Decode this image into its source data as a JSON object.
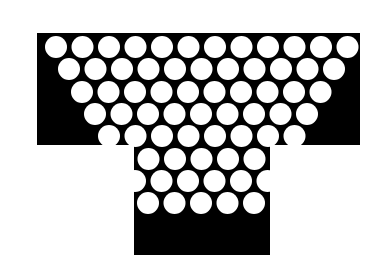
{
  "canvas": {
    "width": 372,
    "height": 255,
    "background_color": "#ffffff"
  },
  "figure": {
    "name": "perforated-t-shape",
    "fill_color": "#000000",
    "hole_color": "#ffffff"
  },
  "shape_geometry": {
    "top_bar": {
      "x": 37,
      "y": 33,
      "width": 323,
      "height": 112,
      "left": 37,
      "right": 360,
      "top": 33,
      "bottom": 145
    },
    "stem": {
      "x": 134,
      "y": 145,
      "width": 136,
      "height": 110,
      "left": 134,
      "right": 270,
      "top": 145,
      "bottom": 255
    }
  },
  "hole_pattern": {
    "type": "inverted-triangle-hex-packing",
    "radius": 11,
    "x_pitch": 26.5,
    "y_pitch": 22.4,
    "first_row_center_x": 56,
    "first_row_center_y": 47,
    "row_count": 8,
    "top_row_hole_count": 12,
    "rows": [
      {
        "index": 0,
        "count": 12,
        "center_y": 47,
        "start_x": 56
      },
      {
        "index": 1,
        "count": 11,
        "center_y": 69,
        "start_x": 69
      },
      {
        "index": 2,
        "count": 10,
        "center_y": 92,
        "start_x": 82
      },
      {
        "index": 3,
        "count": 9,
        "center_y": 114,
        "start_x": 95
      },
      {
        "index": 4,
        "count": 8,
        "center_y": 136,
        "start_x": 109
      },
      {
        "index": 5,
        "count": 7,
        "center_y": 159,
        "start_x": 122
      },
      {
        "index": 6,
        "count": 6,
        "center_y": 181,
        "start_x": 135
      },
      {
        "index": 7,
        "count": 5,
        "center_y": 203,
        "start_x": 148
      }
    ],
    "total_holes": 68
  }
}
